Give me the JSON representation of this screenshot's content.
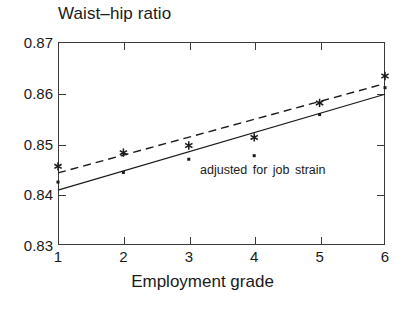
{
  "chart_data": {
    "type": "scatter",
    "title": "Waist–hip ratio",
    "xlabel": "Employment grade",
    "ylabel": "",
    "grid": false,
    "legend_position": "inline-annotation",
    "xlim": [
      1,
      6
    ],
    "ylim": [
      0.83,
      0.87
    ],
    "x": [
      1,
      2,
      3,
      4,
      5,
      6
    ],
    "xtick_labels": [
      "1",
      "2",
      "3",
      "4",
      "5",
      "6"
    ],
    "ytick_labels": [
      "0.87",
      "0.86",
      "0.85",
      "0.84",
      "0.83"
    ],
    "ytick_values": [
      0.87,
      0.86,
      0.85,
      0.84,
      0.83
    ],
    "annotations": [
      {
        "text": "adjusted for job strain",
        "x": 3.1,
        "y": 0.8465
      }
    ],
    "series": [
      {
        "name": "unadjusted",
        "marker": "asterisk",
        "line_style": "dashed",
        "values": [
          0.8455,
          0.8482,
          0.8496,
          0.8512,
          0.858,
          0.8633
        ],
        "fit_start": 0.8442,
        "fit_end": 0.8618
      },
      {
        "name": "adjusted for job strain",
        "marker": "dot",
        "line_style": "solid",
        "values": [
          0.8424,
          0.8443,
          0.8469,
          0.8476,
          0.8557,
          0.861
        ],
        "fit_start": 0.8408,
        "fit_end": 0.8597
      }
    ]
  },
  "axes": {
    "y_ticks": [
      {
        "label": "0.87",
        "value": 0.87
      },
      {
        "label": "0.86",
        "value": 0.86
      },
      {
        "label": "0.85",
        "value": 0.85
      },
      {
        "label": "0.84",
        "value": 0.84
      },
      {
        "label": "0.83",
        "value": 0.83
      }
    ],
    "x_ticks": [
      {
        "label": "1",
        "value": 1
      },
      {
        "label": "2",
        "value": 2
      },
      {
        "label": "3",
        "value": 3
      },
      {
        "label": "4",
        "value": 4
      },
      {
        "label": "5",
        "value": 5
      },
      {
        "label": "6",
        "value": 6
      }
    ]
  },
  "colors": {
    "axis": "#3a3a3a",
    "ink": "#1a1a1a",
    "background": "#ffffff"
  }
}
